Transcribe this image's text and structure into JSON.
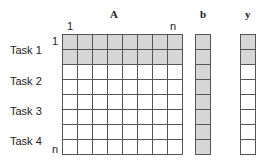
{
  "matrix_label": "A",
  "vector_b_label": "b",
  "vector_y_label": "y",
  "col_start_label": "1",
  "col_end_label": "n",
  "row_start_label": "1",
  "row_end_label": "n",
  "tasks": [
    "Task 1",
    "Task 2",
    "Task 3",
    "Task 4"
  ],
  "grid": {
    "rows": 8,
    "cols": 8,
    "shaded_rows_A": [
      0,
      1
    ],
    "shaded_rows_b": [
      0,
      1,
      2,
      3,
      4,
      5,
      6,
      7
    ],
    "shaded_rows_y": [
      0,
      1
    ]
  },
  "colors": {
    "shade": "#d6d6d6",
    "line": "#555555"
  }
}
